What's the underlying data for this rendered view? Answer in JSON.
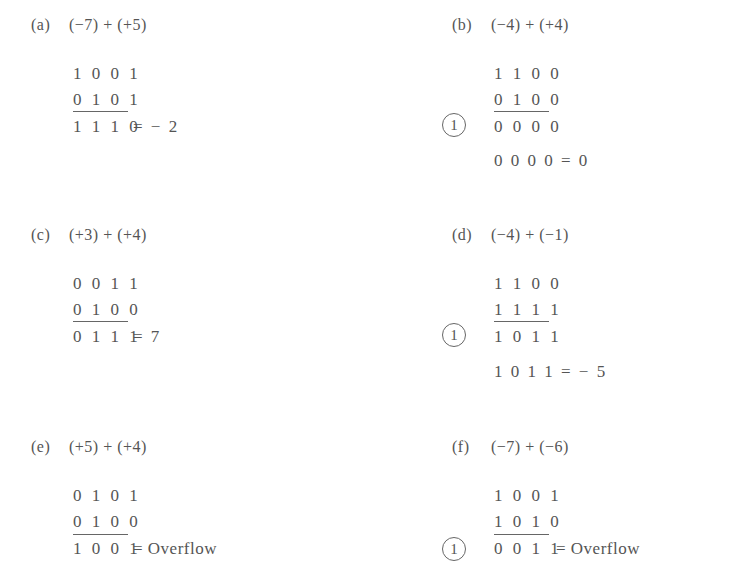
{
  "problems": [
    {
      "id": "a",
      "label": "(a)",
      "expression": "(−7) + (+5)",
      "augend": "1 0 0 1",
      "addend": "0 1 0 1",
      "sum": "1 1 1 0",
      "result": "= − 2",
      "carry": null,
      "final": null
    },
    {
      "id": "b",
      "label": "(b)",
      "expression": "(−4) + (+4)",
      "augend": "1 1 0 0",
      "addend": "0 1 0 0",
      "sum": "0 0 0 0",
      "result": "",
      "carry": "1",
      "final": "0 0 0 0 = 0"
    },
    {
      "id": "c",
      "label": "(c)",
      "expression": "(+3) + (+4)",
      "augend": "0 0 1 1",
      "addend": "0 1 0 0",
      "sum": "0 1 1 1",
      "result": "= 7",
      "carry": null,
      "final": null
    },
    {
      "id": "d",
      "label": "(d)",
      "expression": "(−4) + (−1)",
      "augend": "1 1 0 0",
      "addend": "1 1 1 1",
      "sum": "1 0 1 1",
      "result": "",
      "carry": "1",
      "final": "1 0 1 1 = − 5"
    },
    {
      "id": "e",
      "label": "(e)",
      "expression": "(+5) + (+4)",
      "augend": "0 1 0 1",
      "addend": "0 1 0 0",
      "sum": "1 0 0 1",
      "result": "= Overflow",
      "carry": null,
      "final": null
    },
    {
      "id": "f",
      "label": "(f)",
      "expression": "(−7) + (−6)",
      "augend": "1 0 0 1",
      "addend": "1 0 1 0",
      "sum": "0 0 1 1",
      "result": "= Overflow",
      "carry": "1",
      "final": null
    }
  ]
}
